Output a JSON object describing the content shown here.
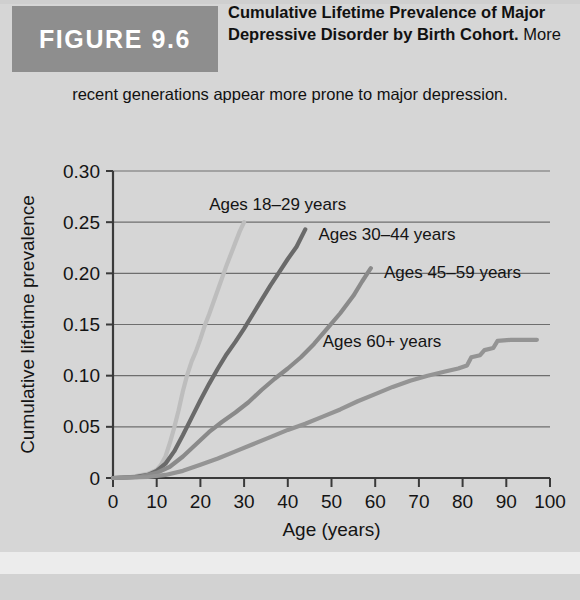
{
  "figure": {
    "badge_label": "FIGURE 9.6",
    "caption_bold": "Cumulative Lifetime Prevalence of Major Depressive Disorder by Birth Cohort.",
    "caption_rest": " More",
    "caption_line2": "recent generations appear more prone to major depression."
  },
  "colors": {
    "page_background": "#d8d8d8",
    "badge_background": "#8e8e8e",
    "badge_text": "#ffffff",
    "axis": "#3a3a3a",
    "gridline": "#6e6e6e",
    "series_18_29": "#bdbdbd",
    "series_30_44": "#6a6a6a",
    "series_45_59": "#8a8a8a",
    "series_60plus": "#949494"
  },
  "chart_data": {
    "type": "line",
    "title": "Cumulative Lifetime Prevalence of Major Depressive Disorder by Birth Cohort",
    "xlabel": "Age (years)",
    "ylabel": "Cumulative lifetime prevalence",
    "xlim": [
      0,
      100
    ],
    "ylim": [
      0,
      0.3
    ],
    "xticks": [
      0,
      10,
      20,
      30,
      40,
      50,
      60,
      70,
      80,
      90,
      100
    ],
    "xtick_labels": [
      "0",
      "10",
      "20",
      "30",
      "40",
      "50",
      "60",
      "70",
      "80",
      "90",
      "100"
    ],
    "yticks": [
      0,
      0.05,
      0.1,
      0.15,
      0.2,
      0.25,
      0.3
    ],
    "ytick_labels": [
      "0",
      "0.05",
      "0.10",
      "0.15",
      "0.20",
      "0.25",
      "0.30"
    ],
    "grid": "horizontal",
    "legend_position": "inline-annotations",
    "series": [
      {
        "name": "Ages 18-29 years",
        "label": "Ages 18–29 years",
        "color": "#bdbdbd",
        "label_x": 22,
        "label_y": 0.262,
        "points": [
          [
            0,
            0.0
          ],
          [
            4,
            0.001
          ],
          [
            8,
            0.004
          ],
          [
            10,
            0.008
          ],
          [
            11,
            0.013
          ],
          [
            12,
            0.021
          ],
          [
            13,
            0.034
          ],
          [
            14,
            0.049
          ],
          [
            15,
            0.066
          ],
          [
            16,
            0.085
          ],
          [
            17,
            0.101
          ],
          [
            18,
            0.114
          ],
          [
            19,
            0.124
          ],
          [
            20,
            0.136
          ],
          [
            21,
            0.149
          ],
          [
            22,
            0.16
          ],
          [
            23,
            0.172
          ],
          [
            24,
            0.184
          ],
          [
            25,
            0.196
          ],
          [
            26,
            0.208
          ],
          [
            27,
            0.219
          ],
          [
            28,
            0.23
          ],
          [
            29,
            0.241
          ],
          [
            30,
            0.25
          ]
        ]
      },
      {
        "name": "Ages 30-44 years",
        "label": "Ages 30–44 years",
        "color": "#6a6a6a",
        "label_x": 47,
        "label_y": 0.233,
        "points": [
          [
            0,
            0.0
          ],
          [
            5,
            0.001
          ],
          [
            8,
            0.003
          ],
          [
            10,
            0.007
          ],
          [
            12,
            0.014
          ],
          [
            14,
            0.026
          ],
          [
            16,
            0.042
          ],
          [
            18,
            0.059
          ],
          [
            20,
            0.076
          ],
          [
            22,
            0.092
          ],
          [
            24,
            0.107
          ],
          [
            26,
            0.121
          ],
          [
            28,
            0.133
          ],
          [
            30,
            0.146
          ],
          [
            32,
            0.16
          ],
          [
            34,
            0.174
          ],
          [
            36,
            0.188
          ],
          [
            38,
            0.201
          ],
          [
            40,
            0.214
          ],
          [
            42,
            0.226
          ],
          [
            44,
            0.243
          ]
        ]
      },
      {
        "name": "Ages 45-59 years",
        "label": "Ages 45–59 years",
        "color": "#8a8a8a",
        "label_x": 62,
        "label_y": 0.195,
        "points": [
          [
            0,
            0.0
          ],
          [
            6,
            0.001
          ],
          [
            10,
            0.005
          ],
          [
            13,
            0.011
          ],
          [
            16,
            0.021
          ],
          [
            19,
            0.033
          ],
          [
            22,
            0.045
          ],
          [
            25,
            0.055
          ],
          [
            28,
            0.064
          ],
          [
            31,
            0.074
          ],
          [
            34,
            0.086
          ],
          [
            37,
            0.097
          ],
          [
            40,
            0.107
          ],
          [
            43,
            0.118
          ],
          [
            46,
            0.131
          ],
          [
            49,
            0.146
          ],
          [
            52,
            0.161
          ],
          [
            55,
            0.178
          ],
          [
            57,
            0.192
          ],
          [
            59,
            0.205
          ]
        ]
      },
      {
        "name": "Ages 60+ years",
        "label": "Ages 60+ years",
        "color": "#949494",
        "label_x": 48,
        "label_y": 0.128,
        "points": [
          [
            0,
            0.0
          ],
          [
            8,
            0.001
          ],
          [
            12,
            0.003
          ],
          [
            16,
            0.007
          ],
          [
            20,
            0.013
          ],
          [
            24,
            0.019
          ],
          [
            28,
            0.026
          ],
          [
            32,
            0.033
          ],
          [
            36,
            0.04
          ],
          [
            40,
            0.047
          ],
          [
            44,
            0.053
          ],
          [
            48,
            0.06
          ],
          [
            52,
            0.067
          ],
          [
            56,
            0.075
          ],
          [
            60,
            0.082
          ],
          [
            64,
            0.089
          ],
          [
            68,
            0.095
          ],
          [
            72,
            0.1
          ],
          [
            76,
            0.104
          ],
          [
            79,
            0.107
          ],
          [
            81,
            0.11
          ],
          [
            82,
            0.118
          ],
          [
            84,
            0.12
          ],
          [
            85,
            0.125
          ],
          [
            87,
            0.127
          ],
          [
            88,
            0.134
          ],
          [
            91,
            0.135
          ],
          [
            97,
            0.135
          ]
        ]
      }
    ]
  }
}
